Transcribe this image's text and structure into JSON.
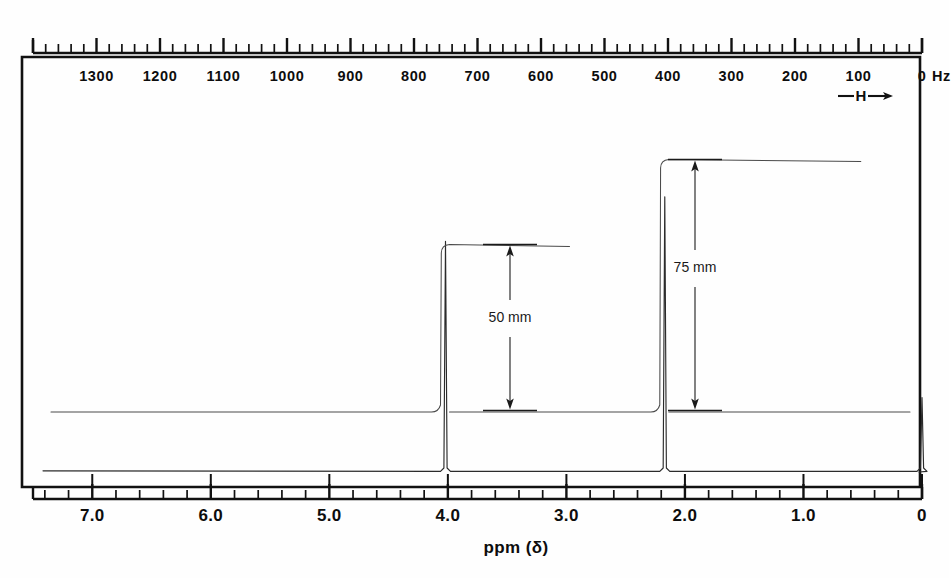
{
  "figure": {
    "kind": "nmr-spectrum",
    "title": "",
    "field_direction_label": "—H→"
  },
  "hz_axis": {
    "unit_label": "0 Hz",
    "unit_suffix": "Hz",
    "ticks": [
      1300,
      1200,
      1100,
      1000,
      900,
      800,
      700,
      600,
      500,
      400,
      300,
      200,
      100,
      0
    ],
    "labels": [
      "1300",
      "1200",
      "1100",
      "1000",
      "900",
      "800",
      "700",
      "600",
      "500",
      "400",
      "300",
      "200",
      "100",
      "0"
    ],
    "minor_step_hz": 20,
    "major_step_hz": 100,
    "range_hz": [
      1400,
      0
    ]
  },
  "ppm_axis": {
    "title": "ppm (δ)",
    "ticks": [
      7.0,
      6.0,
      5.0,
      4.0,
      3.0,
      2.0,
      1.0,
      0
    ],
    "labels": [
      "7.0",
      "6.0",
      "5.0",
      "4.0",
      "3.0",
      "2.0",
      "1.0",
      "0"
    ],
    "minor_step_ppm": 0.2,
    "major_step_ppm": 1.0,
    "range_ppm": [
      7.5,
      0
    ]
  },
  "annotations": {
    "integral_a": {
      "text": "50 mm",
      "value_mm": 50,
      "for_peak_ppm": 4.02
    },
    "integral_b": {
      "text": "75 mm",
      "value_mm": 75,
      "for_peak_ppm": 2.17
    }
  },
  "chart_data": {
    "type": "line",
    "title": "",
    "xlabel": "ppm (δ)",
    "ylabel": "",
    "xlim": [
      7.5,
      0
    ],
    "grid": false,
    "legend": "none",
    "x_axis_secondary": {
      "label": "Hz",
      "lim": [
        1400,
        0
      ]
    },
    "peaks": [
      {
        "name": "peak-a",
        "ppm": 4.02,
        "hz": 241,
        "rel_height": 0.62,
        "integral_mm": 50
      },
      {
        "name": "peak-b",
        "ppm": 2.17,
        "hz": 130,
        "rel_height": 0.74,
        "integral_mm": 75
      },
      {
        "name": "tms-reference",
        "ppm": 0.0,
        "hz": 0,
        "rel_height": 0.2,
        "integral_mm": 0
      }
    ],
    "integral_steps": [
      {
        "name": "step-a",
        "ppm": 4.02,
        "height_mm": 50
      },
      {
        "name": "step-b",
        "ppm": 2.17,
        "height_mm": 75
      }
    ],
    "notes": [
      "Proton NMR trace with two singlets and a TMS reference at 0 ppm",
      "Integration step heights annotated as 50 mm and 75 mm"
    ]
  }
}
